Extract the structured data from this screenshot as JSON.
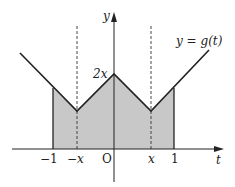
{
  "diagram": {
    "type": "function-graph",
    "function_label": "y = g(t)",
    "axes": {
      "x_axis_label": "t",
      "y_axis_label": "y",
      "origin_label": "O"
    },
    "tick_labels": {
      "neg_one": "−1",
      "neg_x": "−x",
      "x": "x",
      "one": "1"
    },
    "peak_label": "2x",
    "shaded_region": "area under y = g(t) from t = −1 to t = 1",
    "dashed_lines": [
      "t = −x",
      "t = x"
    ],
    "colors": {
      "line": "#222222",
      "fill": "#c8c8c8",
      "background": "#ffffff"
    }
  }
}
